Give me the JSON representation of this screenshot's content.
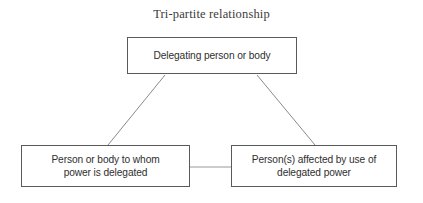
{
  "diagram": {
    "title": "Tri-partite relationship",
    "type": "flowchart",
    "background_color": "#ffffff",
    "border_color": "#5a5a5a",
    "text_color": "#2f2f2f",
    "connector_color": "#8a8a8a",
    "nodes": [
      {
        "id": "delegator",
        "label": "Delegating person or body",
        "position": "top-center"
      },
      {
        "id": "delegatee",
        "label": "Person or body to whom power is delegated",
        "line1": "Person or body to whom",
        "line2": "power is delegated",
        "position": "bottom-left"
      },
      {
        "id": "affected",
        "label": "Person(s) affected by use of delegated power",
        "line1": "Person(s) affected by use of",
        "line2": "delegated power",
        "position": "bottom-right"
      }
    ],
    "connectors": [
      {
        "id": "delegator-to-delegatee",
        "from": "delegator",
        "to": "delegatee",
        "style": "diagonal-line"
      },
      {
        "id": "delegator-to-affected",
        "from": "delegator",
        "to": "affected",
        "style": "diagonal-line"
      },
      {
        "id": "delegatee-to-affected",
        "from": "delegatee",
        "to": "affected",
        "style": "horizontal-line"
      }
    ]
  }
}
